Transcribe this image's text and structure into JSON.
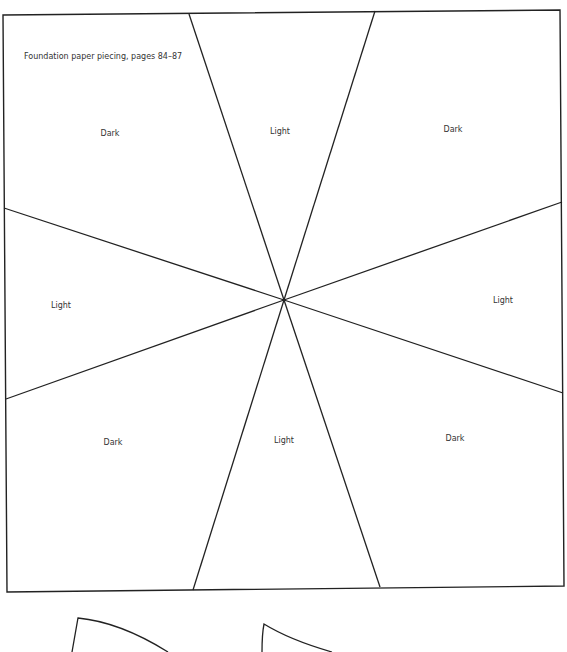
{
  "document": {
    "caption": "Foundation paper piecing, pages 84–87",
    "line_color": "#222222",
    "text_color": "#333333"
  },
  "block": {
    "outline": [
      [
        3,
        15
      ],
      [
        560,
        10
      ],
      [
        564,
        586
      ],
      [
        7,
        592
      ]
    ],
    "center": [
      284,
      300
    ],
    "spokes": [
      {
        "from": [
          189,
          14
        ],
        "to": [
          284,
          300
        ]
      },
      {
        "from": [
          375,
          11
        ],
        "to": [
          284,
          300
        ]
      },
      {
        "from": [
          562,
          202
        ],
        "to": [
          284,
          300
        ]
      },
      {
        "from": [
          563,
          393
        ],
        "to": [
          284,
          300
        ]
      },
      {
        "from": [
          380,
          587
        ],
        "to": [
          284,
          300
        ]
      },
      {
        "from": [
          193,
          590
        ],
        "to": [
          284,
          300
        ]
      },
      {
        "from": [
          6,
          399
        ],
        "to": [
          284,
          300
        ]
      },
      {
        "from": [
          4,
          208
        ],
        "to": [
          284,
          300
        ]
      }
    ],
    "sections": [
      {
        "id": "top-left",
        "label": "Dark",
        "x": 110,
        "y": 133
      },
      {
        "id": "top-center",
        "label": "Light",
        "x": 280,
        "y": 131
      },
      {
        "id": "top-right",
        "label": "Dark",
        "x": 453,
        "y": 129
      },
      {
        "id": "middle-left",
        "label": "Light",
        "x": 61,
        "y": 305
      },
      {
        "id": "middle-right",
        "label": "Light",
        "x": 503,
        "y": 300
      },
      {
        "id": "bottom-left",
        "label": "Dark",
        "x": 113,
        "y": 442
      },
      {
        "id": "bottom-center",
        "label": "Light",
        "x": 284,
        "y": 440
      },
      {
        "id": "bottom-right",
        "label": "Dark",
        "x": 455,
        "y": 438
      }
    ]
  },
  "templates": [
    {
      "id": "curved-template-1"
    },
    {
      "id": "curved-template-2"
    }
  ]
}
